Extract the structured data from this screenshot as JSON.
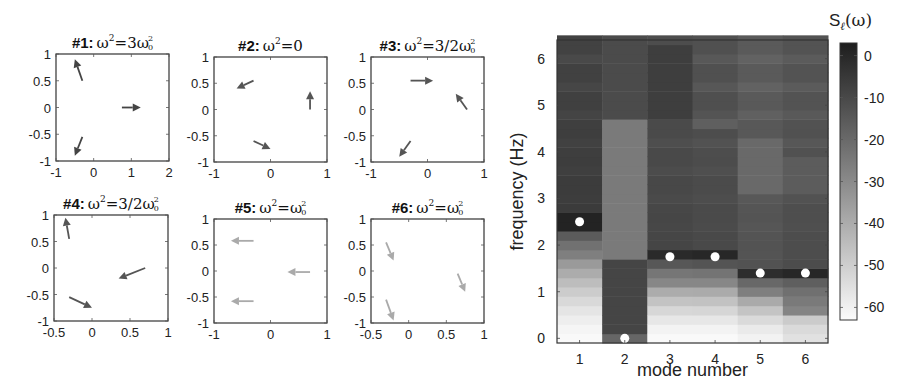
{
  "chart_data": [
    {
      "type": "quiver",
      "panel": 1,
      "title": "#1: ω²=3ω₀²",
      "title_parts": {
        "prefix": "#1:",
        "lhs": "ω",
        "rhs": "3ω",
        "sub": "0"
      },
      "xlim": [
        -1,
        2
      ],
      "ylim": [
        -1,
        1
      ],
      "xticks": [
        "-1",
        "0",
        "1",
        "2"
      ],
      "yticks": [
        "-1",
        "-0.5",
        "0",
        "0.5",
        "1"
      ],
      "color": "#444444",
      "arrows": [
        {
          "x0": -0.3,
          "y0": 0.5,
          "x1": -0.5,
          "y1": 0.9
        },
        {
          "x0": 0.75,
          "y0": 0.0,
          "x1": 1.25,
          "y1": 0.0
        },
        {
          "x0": -0.3,
          "y0": -0.55,
          "x1": -0.5,
          "y1": -0.9
        }
      ]
    },
    {
      "type": "quiver",
      "panel": 2,
      "title": "#2: ω²=0",
      "title_parts": {
        "prefix": "#2:",
        "lhs": "ω",
        "rhs": "0",
        "sub": ""
      },
      "xlim": [
        -1,
        1
      ],
      "ylim": [
        -1,
        1
      ],
      "xticks": [
        "-1",
        "0",
        "1"
      ],
      "yticks": [
        "-1",
        "-0.5",
        "0",
        "0.5",
        "1"
      ],
      "color": "#555555",
      "arrows": [
        {
          "x0": -0.3,
          "y0": 0.55,
          "x1": -0.6,
          "y1": 0.4
        },
        {
          "x0": 0.7,
          "y0": 0.0,
          "x1": 0.7,
          "y1": 0.35
        },
        {
          "x0": -0.3,
          "y0": -0.6,
          "x1": 0.0,
          "y1": -0.75
        }
      ]
    },
    {
      "type": "quiver",
      "panel": 3,
      "title": "#3: ω²=3/2ω₀²",
      "title_parts": {
        "prefix": "#3:",
        "lhs": "ω",
        "rhs": "3/2ω",
        "sub": "0"
      },
      "xlim": [
        -1,
        1
      ],
      "ylim": [
        -1,
        1
      ],
      "xticks": [
        "-1",
        "0",
        "1"
      ],
      "yticks": [
        "-1",
        "-0.5",
        "0",
        "0.5",
        "1"
      ],
      "color": "#555555",
      "arrows": [
        {
          "x0": -0.3,
          "y0": 0.55,
          "x1": 0.1,
          "y1": 0.55
        },
        {
          "x0": 0.7,
          "y0": 0.0,
          "x1": 0.5,
          "y1": 0.3
        },
        {
          "x0": -0.3,
          "y0": -0.6,
          "x1": -0.5,
          "y1": -0.9
        }
      ]
    },
    {
      "type": "quiver",
      "panel": 4,
      "title": "#4: ω²=3/2ω₀²",
      "title_parts": {
        "prefix": "#4:",
        "lhs": "ω",
        "rhs": "3/2ω",
        "sub": "0"
      },
      "xlim": [
        -0.5,
        1
      ],
      "ylim": [
        -1,
        1
      ],
      "xticks": [
        "-0.5",
        "0",
        "0.5",
        "1"
      ],
      "yticks": [
        "-1",
        "-0.5",
        "0",
        "0.5",
        "1"
      ],
      "color": "#555555",
      "arrows": [
        {
          "x0": -0.3,
          "y0": 0.55,
          "x1": -0.35,
          "y1": 0.95
        },
        {
          "x0": 0.7,
          "y0": 0.0,
          "x1": 0.35,
          "y1": -0.2
        },
        {
          "x0": -0.3,
          "y0": -0.55,
          "x1": 0.0,
          "y1": -0.75
        }
      ]
    },
    {
      "type": "quiver",
      "panel": 5,
      "title": "#5: ω²=ω₀²",
      "title_parts": {
        "prefix": "#5:",
        "lhs": "ω",
        "rhs": "ω",
        "sub": "0"
      },
      "xlim": [
        -1,
        1
      ],
      "ylim": [
        -1,
        1
      ],
      "xticks": [
        "-1",
        "0",
        "1"
      ],
      "yticks": [
        "-1",
        "-0.5",
        "0",
        "0.5",
        "1"
      ],
      "color": "#aaaaaa",
      "arrows": [
        {
          "x0": -0.3,
          "y0": 0.58,
          "x1": -0.7,
          "y1": 0.58
        },
        {
          "x0": 0.7,
          "y0": -0.02,
          "x1": 0.3,
          "y1": -0.02
        },
        {
          "x0": -0.3,
          "y0": -0.58,
          "x1": -0.7,
          "y1": -0.58
        }
      ]
    },
    {
      "type": "quiver",
      "panel": 6,
      "title": "#6: ω²=ω₀²",
      "title_parts": {
        "prefix": "#6:",
        "lhs": "ω",
        "rhs": "ω",
        "sub": "0"
      },
      "xlim": [
        -0.5,
        1
      ],
      "ylim": [
        -1,
        1
      ],
      "xticks": [
        "-0.5",
        "0",
        "0.5",
        "1"
      ],
      "yticks": [
        "-1",
        "-0.5",
        "0",
        "0.5",
        "1"
      ],
      "color": "#aaaaaa",
      "arrows": [
        {
          "x0": -0.3,
          "y0": 0.55,
          "x1": -0.2,
          "y1": 0.2
        },
        {
          "x0": 0.65,
          "y0": -0.05,
          "x1": 0.75,
          "y1": -0.4
        },
        {
          "x0": -0.3,
          "y0": -0.55,
          "x1": -0.2,
          "y1": -0.95
        }
      ]
    },
    {
      "type": "heatmap",
      "title": "",
      "xlabel": "mode number",
      "ylabel": "frequency (Hz)",
      "xticks": [
        "1",
        "2",
        "3",
        "4",
        "5",
        "6"
      ],
      "yticks": [
        "0",
        "1",
        "2",
        "3",
        "4",
        "5",
        "6"
      ],
      "xlim": [
        0.5,
        6.5
      ],
      "ylim": [
        -0.1,
        6.4
      ],
      "freq_bin_hz": 0.2,
      "colorbar": {
        "label_main": "S",
        "label_sub": "ℓ",
        "label_tail": "(ω)",
        "ticks": [
          "0",
          "-10",
          "-20",
          "-30",
          "-40",
          "-50",
          "-60"
        ],
        "range": [
          -63,
          3
        ],
        "colormap": "gray_reversed"
      },
      "peaks": [
        {
          "mode": 1,
          "freq": 2.5
        },
        {
          "mode": 2,
          "freq": 0.0
        },
        {
          "mode": 3,
          "freq": 1.75
        },
        {
          "mode": 4,
          "freq": 1.75
        },
        {
          "mode": 5,
          "freq": 1.4
        },
        {
          "mode": 6,
          "freq": 1.4
        }
      ],
      "columns": [
        {
          "mode": 1,
          "low_db": -62,
          "knee": 1.5,
          "peak_db": 2,
          "high_db": -5,
          "bands": []
        },
        {
          "mode": 2,
          "low_db": -12,
          "knee": 0.0,
          "peak_db": -5,
          "high_db": -10,
          "bands": [
            {
              "from": 1.7,
              "to": 4.7,
              "db": -24
            },
            {
              "from": 0.0,
              "to": 1.7,
              "db": -8
            }
          ]
        },
        {
          "mode": 3,
          "low_db": -62,
          "knee": 1.05,
          "peak_db": 0,
          "high_db": -8,
          "bands": [
            {
              "from": 4.7,
              "to": 6.4,
              "db": -6
            }
          ]
        },
        {
          "mode": 4,
          "low_db": -62,
          "knee": 1.05,
          "peak_db": 1,
          "high_db": -9,
          "bands": [
            {
              "from": 4.55,
              "to": 4.8,
              "db": -16
            }
          ]
        },
        {
          "mode": 5,
          "low_db": -60,
          "knee": 0.7,
          "peak_db": -1,
          "high_db": -12,
          "bands": [
            {
              "from": 3.1,
              "to": 4.3,
              "db": -19
            }
          ]
        },
        {
          "mode": 6,
          "low_db": -55,
          "knee": 0.4,
          "peak_db": 1,
          "high_db": -10,
          "bands": [
            {
              "from": 3.2,
              "to": 3.9,
              "db": -15
            }
          ]
        }
      ]
    }
  ]
}
